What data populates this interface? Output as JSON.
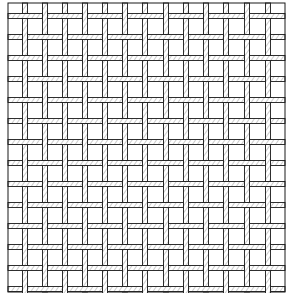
{
  "figure": {
    "width": 290,
    "height": 295,
    "background": "#ffffff",
    "ink": "#1a1a1a",
    "frame": {
      "x1": 8,
      "y1": 3,
      "x2": 285,
      "y2": 292
    },
    "vertical_wires_x": [
      25,
      45,
      65,
      85,
      105,
      125,
      145,
      166,
      186,
      206,
      226,
      247,
      268
    ],
    "horizontal_wires_y": [
      16,
      37,
      58,
      79,
      100,
      121,
      142,
      163,
      184,
      205,
      226,
      247,
      268,
      289
    ],
    "wire_width": 5
  }
}
